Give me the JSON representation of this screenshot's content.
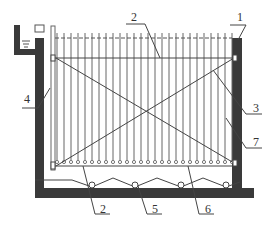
{
  "diagram": {
    "type": "schematic cross-section",
    "labels": [
      {
        "id": "1",
        "text": "1",
        "x": 237,
        "y": 21,
        "leader": [
          [
            230,
            25
          ],
          [
            246,
            25
          ],
          [
            246,
            25
          ],
          [
            238,
            40
          ]
        ]
      },
      {
        "id": "2-top",
        "text": "2",
        "x": 131,
        "y": 21,
        "leader": [
          [
            126,
            24
          ],
          [
            145,
            24
          ],
          [
            160,
            58
          ]
        ]
      },
      {
        "id": "3",
        "text": "3",
        "x": 253,
        "y": 112,
        "leader": [
          [
            213,
            70
          ],
          [
            246,
            114
          ],
          [
            262,
            114
          ]
        ]
      },
      {
        "id": "4",
        "text": "4",
        "x": 24,
        "y": 103,
        "leader": [
          [
            22,
            108
          ],
          [
            38,
            108
          ],
          [
            50,
            88
          ]
        ]
      },
      {
        "id": "2-bottom",
        "text": "2",
        "x": 100,
        "y": 213,
        "leader": [
          [
            83,
            166
          ],
          [
            95,
            214
          ],
          [
            110,
            214
          ]
        ]
      },
      {
        "id": "5",
        "text": "5",
        "x": 152,
        "y": 213,
        "leader": [
          [
            138,
            186
          ],
          [
            147,
            214
          ],
          [
            162,
            214
          ]
        ]
      },
      {
        "id": "6",
        "text": "6",
        "x": 205,
        "y": 213,
        "leader": [
          [
            188,
            166
          ],
          [
            199,
            214
          ],
          [
            214,
            214
          ]
        ]
      },
      {
        "id": "7",
        "text": "7",
        "x": 253,
        "y": 146,
        "leader": [
          [
            226,
            118
          ],
          [
            246,
            148
          ],
          [
            262,
            148
          ]
        ]
      }
    ],
    "colors": {
      "wall": "#3a3a3a",
      "line": "#555555",
      "background": "#ffffff"
    },
    "rods": {
      "count": 26,
      "x_start": 57,
      "x_end": 232,
      "y_top": 33,
      "y_bottom": 160
    }
  }
}
